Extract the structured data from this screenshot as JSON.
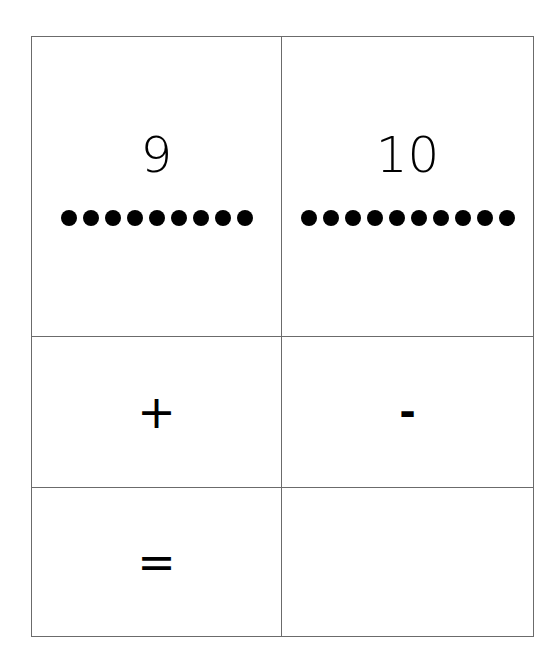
{
  "cards": [
    {
      "id": "nine",
      "label": "9",
      "dot_count": 9
    },
    {
      "id": "ten",
      "label": "10",
      "dot_count": 10
    },
    {
      "id": "plus",
      "label": "+"
    },
    {
      "id": "minus",
      "label": "-"
    },
    {
      "id": "equals",
      "label": "="
    },
    {
      "id": "blank",
      "label": ""
    }
  ]
}
